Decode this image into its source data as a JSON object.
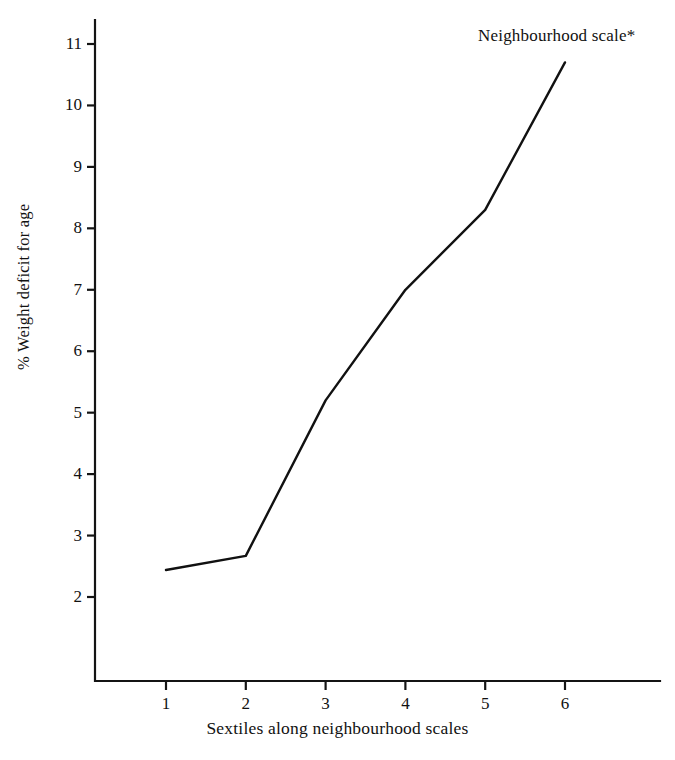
{
  "chart_data": {
    "type": "line",
    "title": "",
    "xlabel": "Sextiles along neighbourhood scales",
    "ylabel": "% Weight deficit for age",
    "x": [
      1,
      2,
      3,
      4,
      5,
      6
    ],
    "xtick_labels": [
      "1",
      "2",
      "3",
      "4",
      "5",
      "6"
    ],
    "ytick_labels": [
      "2",
      "3",
      "4",
      "5",
      "6",
      "7",
      "8",
      "9",
      "10",
      "11"
    ],
    "yticks": [
      2,
      3,
      4,
      5,
      6,
      7,
      8,
      9,
      10,
      11
    ],
    "xlim": [
      0.6,
      6.4
    ],
    "ylim": [
      1.35,
      11.35
    ],
    "grid": false,
    "legend_position": "inline-annotation",
    "series": [
      {
        "name": "Neighbourhood scale*",
        "values": [
          2.44,
          2.67,
          5.2,
          7.0,
          8.3,
          10.7
        ],
        "color": "#111111"
      }
    ],
    "annotations": [
      {
        "name": "series-label",
        "text": "Neighbourhood scale*",
        "x": 5.6,
        "y": 11.15
      }
    ]
  },
  "axes": {
    "y_title": "% Weight deficit for age",
    "x_title": "Sextiles along neighbourhood scales"
  }
}
